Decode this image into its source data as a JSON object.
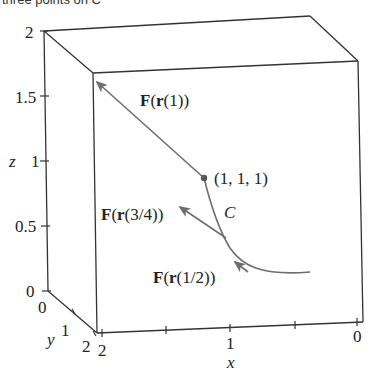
{
  "caption_fragment": "three points on C",
  "axes": {
    "z": {
      "label": "z",
      "ticks": [
        "0",
        "0.5",
        "1",
        "1.5",
        "2"
      ]
    },
    "y": {
      "label": "y",
      "ticks": [
        "0",
        "1",
        "2"
      ]
    },
    "x": {
      "label": "x",
      "ticks": [
        "2",
        "1",
        "0"
      ]
    }
  },
  "labels": {
    "point": "(1, 1, 1)",
    "curve": "C",
    "f1_bold": "F",
    "f1_open": "(",
    "f1_r": "r",
    "f1_arg": "(1))",
    "f34_bold": "F",
    "f34_open": "(",
    "f34_r": "r",
    "f34_arg": "(3/4))",
    "f12_bold": "F",
    "f12_open": "(",
    "f12_r": "r",
    "f12_arg": "(1/2))"
  },
  "colors": {
    "box": "#333333",
    "curve": "#6e6e6e",
    "vector": "#6e6e6e"
  }
}
